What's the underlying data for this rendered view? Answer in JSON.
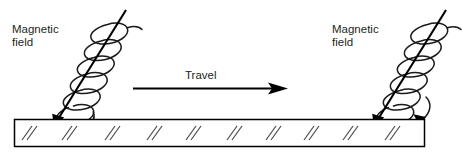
{
  "figure": {
    "title_present": false,
    "background_color": "#ffffff",
    "ink_color": "#000000",
    "text_color": "#231f20",
    "width": 462,
    "height": 154
  },
  "labels": {
    "left_field_line1": "Magnetic",
    "left_field_line2": "field",
    "right_field_line1": "Magnetic",
    "right_field_line2": "field",
    "travel": "Travel"
  },
  "diagram_data": {
    "type": "schematic",
    "subject": "magnetic field helices over a travelling hatched bar",
    "elements": [
      {
        "name": "left-magnetic-field-helix",
        "kind": "helix",
        "loops": 6,
        "axis_top": [
          120,
          12
        ],
        "axis_tip": [
          56,
          122
        ],
        "arrowheads": 1,
        "tilt_direction": "down-left"
      },
      {
        "name": "travel-arrow",
        "kind": "arrow",
        "from": [
          133,
          88
        ],
        "to": [
          287,
          88
        ],
        "direction": "right",
        "label": "Travel"
      },
      {
        "name": "right-magnetic-field-helix",
        "kind": "helix",
        "loops": 6,
        "axis_top": [
          440,
          12
        ],
        "axis_tip": [
          376,
          122
        ],
        "arrowheads": 2,
        "tilt_direction": "down-left"
      },
      {
        "name": "workpiece-bar",
        "kind": "rectangle",
        "x": 14,
        "y": 119,
        "width": 411,
        "height": 28,
        "hatch_pairs": 10
      }
    ]
  }
}
